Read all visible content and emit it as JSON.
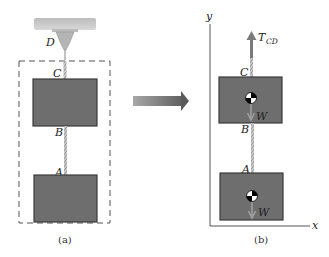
{
  "figure": {
    "panel_a": {
      "caption": "(a)",
      "labels": {
        "support_point": "D",
        "top_attach": "C",
        "lower_attach_upper_block": "B",
        "upper_attach_lower_block": "A"
      }
    },
    "panel_b": {
      "caption": "(b)",
      "axes": {
        "x": "x",
        "y": "y"
      },
      "labels": {
        "top_attach": "C",
        "middle_link_top": "B",
        "lower_attach": "A"
      },
      "forces": {
        "tension": {
          "symbol": "T",
          "subscript": "CD"
        },
        "weight_upper": "W",
        "weight_lower": "W"
      }
    },
    "colors": {
      "block_fill": "#6e6e6e",
      "block_border": "#3a3a3a",
      "arrow_fill": "#7a7a7a",
      "support_fill": "#c8c8c8",
      "dashed_box": "#555555",
      "weight_arrow": "#9a9a9a"
    }
  }
}
